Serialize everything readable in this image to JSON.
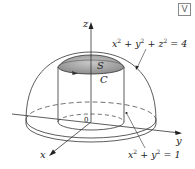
{
  "badge": {
    "label": "V",
    "icon": "video-icon"
  },
  "axes": {
    "x_label": "x",
    "y_label": "y",
    "z_label": "z",
    "origin_label": "0"
  },
  "labels": {
    "surface": "S",
    "curve": "C",
    "sphere_equation": {
      "base": "x² + y² + z² = 4",
      "parts": [
        "x",
        "2",
        " + y",
        "2",
        " + z",
        "2",
        " = 4"
      ]
    },
    "cylinder_equation": {
      "base": "x² + y² = 1",
      "parts": [
        "x",
        "2",
        " + y",
        "2",
        " = 1"
      ]
    }
  },
  "colors": {
    "line": "#333333",
    "cap_fill": "#9a9a9a",
    "cap_highlight": "#c8c8c8",
    "badge_border": "#888888"
  }
}
